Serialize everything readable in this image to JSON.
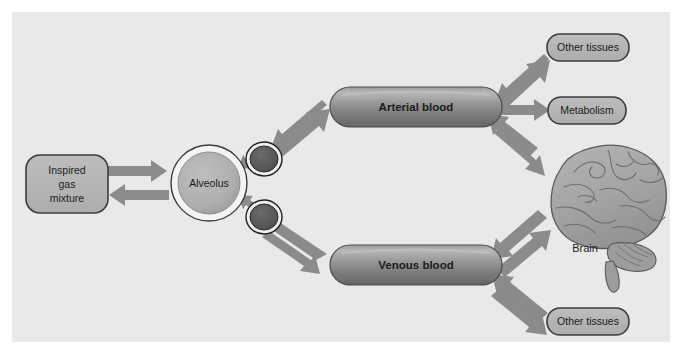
{
  "figure": {
    "background_color": "#ffffff",
    "panel_color": "#e9e9e9"
  },
  "palette": {
    "box_fill": "#b4b4b4",
    "box_stroke": "#3c3c3c",
    "vessel_fill_light": "#a9a9a9",
    "vessel_fill_dark": "#6f6f6f",
    "vessel_stroke": "#4a4a4a",
    "alveolus_fill": "#b0b0b0",
    "alveolus_ring": "#f4f4f4",
    "alveolus_stroke": "#3c3c3c",
    "capillary_fill": "#5e5e5e",
    "capillary_stroke": "#1f1f1f",
    "arrow_color": "#8a8a8a",
    "brain_fill": "#a8a8a8",
    "brain_stroke": "#5a5a5a",
    "text_color": "#1b1b1b"
  },
  "nodes": {
    "inspired_gas": {
      "label": "Inspired\ngas\nmixture",
      "lines": [
        "Inspired",
        "gas",
        "mixture"
      ],
      "shape": "rounded-rect"
    },
    "alveolus": {
      "label": "Alveolus",
      "shape": "circle-with-ring"
    },
    "capillary_upper": {
      "label": "",
      "shape": "filled-ellipse"
    },
    "capillary_lower": {
      "label": "",
      "shape": "filled-ellipse"
    },
    "arterial_blood": {
      "label": "Arterial blood",
      "shape": "cylinder"
    },
    "venous_blood": {
      "label": "Venous blood",
      "shape": "cylinder"
    },
    "other_tissues_top": {
      "label": "Other tissues",
      "shape": "rounded-rect"
    },
    "metabolism": {
      "label": "Metabolism",
      "shape": "rounded-rect"
    },
    "brain": {
      "label": "Brain",
      "shape": "brain-illustration"
    },
    "other_tissues_bottom": {
      "label": "Other tissues",
      "shape": "rounded-rect"
    }
  },
  "connections": [
    {
      "id": "gas-to-alveolus",
      "from": "inspired_gas",
      "to": "alveolus",
      "direction": "right",
      "style": "block-arrow"
    },
    {
      "id": "alveolus-to-gas",
      "from": "alveolus",
      "to": "inspired_gas",
      "direction": "left",
      "style": "block-arrow"
    },
    {
      "id": "capillary-upper-to-arterial",
      "from": "capillary_upper",
      "to": "arterial_blood",
      "direction": "up-right",
      "style": "block-arrow"
    },
    {
      "id": "arterial-to-capillary-upper",
      "from": "arterial_blood",
      "to": "capillary_upper",
      "direction": "down-left",
      "style": "block-arrow"
    },
    {
      "id": "capillary-upper-to-alveolus",
      "from": "capillary_upper",
      "to": "alveolus",
      "direction": "left",
      "style": "block-arrow"
    },
    {
      "id": "capillary-lower-to-alveolus",
      "from": "capillary_lower",
      "to": "alveolus",
      "direction": "up-left",
      "style": "block-arrow"
    },
    {
      "id": "venous-to-capillary-lower",
      "from": "venous_blood",
      "to": "capillary_lower",
      "direction": "up-left",
      "style": "block-arrow"
    },
    {
      "id": "capillary-lower-to-venous",
      "from": "capillary_lower",
      "to": "venous_blood",
      "direction": "down-right",
      "style": "block-arrow"
    },
    {
      "id": "arterial-to-other-tissues-top",
      "from": "arterial_blood",
      "to": "other_tissues_top",
      "direction": "up-right",
      "style": "block-arrow"
    },
    {
      "id": "other-tissues-top-to-arterial",
      "from": "other_tissues_top",
      "to": "arterial_blood",
      "direction": "down-left",
      "style": "block-arrow"
    },
    {
      "id": "arterial-to-metabolism",
      "from": "arterial_blood",
      "to": "metabolism",
      "direction": "right",
      "style": "block-arrow"
    },
    {
      "id": "arterial-to-brain",
      "from": "arterial_blood",
      "to": "brain",
      "direction": "down-right",
      "style": "block-arrow"
    },
    {
      "id": "brain-to-arterial",
      "from": "brain",
      "to": "arterial_blood",
      "direction": "up-left",
      "style": "block-arrow"
    },
    {
      "id": "brain-to-venous",
      "from": "brain",
      "to": "venous_blood",
      "direction": "down-left",
      "style": "block-arrow"
    },
    {
      "id": "venous-to-brain",
      "from": "venous_blood",
      "to": "brain",
      "direction": "up-right",
      "style": "block-arrow"
    },
    {
      "id": "other-tissues-bottom-to-venous",
      "from": "other_tissues_bottom",
      "to": "venous_blood",
      "direction": "up-left",
      "style": "block-arrow"
    },
    {
      "id": "venous-to-other-tissues-bottom",
      "from": "venous_blood",
      "to": "other_tissues_bottom",
      "direction": "down-right",
      "style": "block-arrow"
    }
  ]
}
